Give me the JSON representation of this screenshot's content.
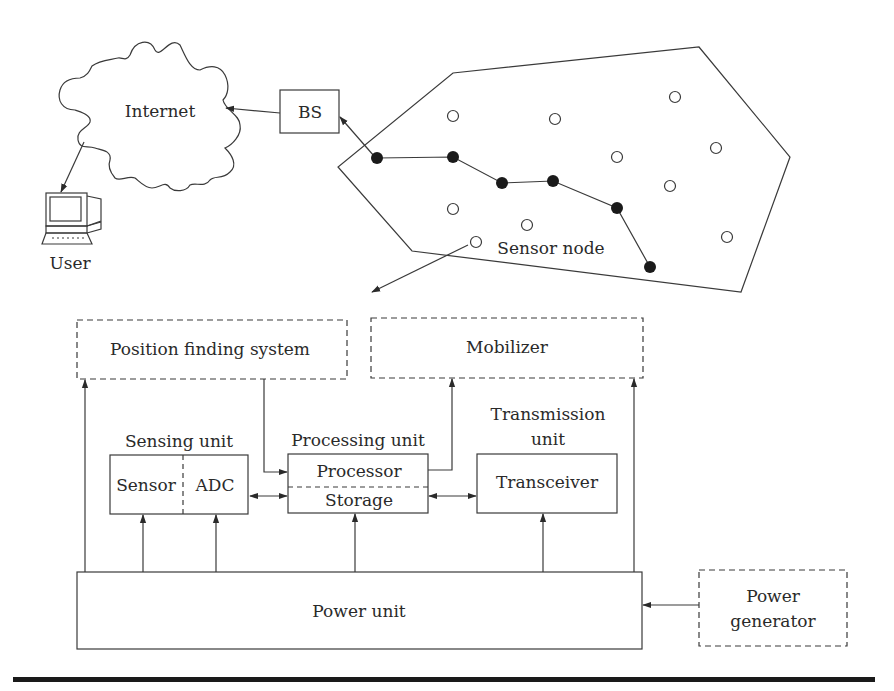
{
  "network": {
    "internet_label": "Internet",
    "bs_label": "BS",
    "user_label": "User",
    "sensor_node_label": "Sensor node",
    "route_nodes": [
      [
        377,
        158
      ],
      [
        453,
        157
      ],
      [
        502,
        183
      ],
      [
        553,
        181
      ],
      [
        617,
        208
      ],
      [
        650,
        267
      ]
    ],
    "idle_nodes": [
      [
        453,
        116
      ],
      [
        555,
        119
      ],
      [
        675,
        97
      ],
      [
        617,
        157
      ],
      [
        716,
        148
      ],
      [
        670,
        186
      ],
      [
        453,
        209
      ],
      [
        527,
        225
      ],
      [
        727,
        237
      ],
      [
        476,
        242
      ]
    ]
  },
  "node_architecture": {
    "position_finding": "Position finding system",
    "mobilizer": "Mobilizer",
    "sensing_unit": {
      "title": "Sensing unit",
      "sensor": "Sensor",
      "adc": "ADC"
    },
    "processing_unit": {
      "title": "Processing unit",
      "processor": "Processor",
      "storage": "Storage"
    },
    "transmission_unit": {
      "title_line1": "Transmission",
      "title_line2": "unit",
      "transceiver": "Transceiver"
    },
    "power_unit": "Power unit",
    "power_generator": {
      "line1": "Power",
      "line2": "generator"
    }
  },
  "colors": {
    "stroke": "#3a3a3a",
    "rule": "#1a1a1a"
  }
}
